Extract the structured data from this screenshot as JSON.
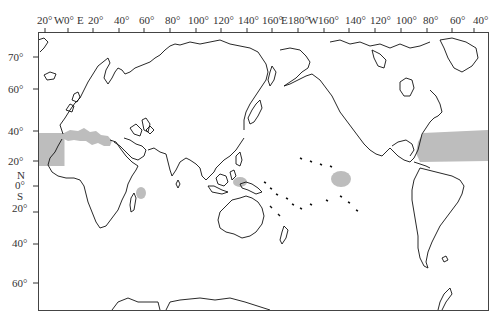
{
  "map": {
    "title": "",
    "projection": "Pacific-centered equirectangular world map",
    "colors": {
      "land_outline": "#111111",
      "shaded_region": "#bdbdbd",
      "frame": "#444444",
      "background": "#ffffff"
    },
    "top_axis_labels": [
      {
        "text": "20°",
        "x": 37
      },
      {
        "text": "W",
        "x": 54
      },
      {
        "text": "0°",
        "x": 64
      },
      {
        "text": "E",
        "x": 77
      },
      {
        "text": "20°",
        "x": 88
      },
      {
        "text": "40°",
        "x": 114
      },
      {
        "text": "60°",
        "x": 139
      },
      {
        "text": "80°",
        "x": 165
      },
      {
        "text": "100°",
        "x": 188
      },
      {
        "text": "120°",
        "x": 213
      },
      {
        "text": "140°",
        "x": 238
      },
      {
        "text": "160°",
        "x": 262
      },
      {
        "text": "E",
        "x": 281
      },
      {
        "text": "180°",
        "x": 288
      },
      {
        "text": "W",
        "x": 308
      },
      {
        "text": "160°",
        "x": 318
      },
      {
        "text": "140°",
        "x": 345
      },
      {
        "text": "120°",
        "x": 370
      },
      {
        "text": "100°",
        "x": 396
      },
      {
        "text": "80°",
        "x": 423
      },
      {
        "text": "60°",
        "x": 450
      },
      {
        "text": "40°",
        "x": 473
      }
    ],
    "top_ticks_x": [
      45,
      68,
      93,
      119,
      144,
      170,
      196,
      221,
      247,
      272,
      298,
      324,
      349,
      375,
      401,
      427,
      452,
      474
    ],
    "left_axis_labels": [
      {
        "text": "70°",
        "y": 56
      },
      {
        "text": "60°",
        "y": 88
      },
      {
        "text": "40°",
        "y": 128
      },
      {
        "text": "20°",
        "y": 158
      },
      {
        "text": "N",
        "y": 172
      },
      {
        "text": "0°",
        "y": 183
      },
      {
        "text": "S",
        "y": 193
      },
      {
        "text": "20°",
        "y": 206
      },
      {
        "text": "40°",
        "y": 240
      },
      {
        "text": "60°",
        "y": 279
      }
    ],
    "left_ticks_y": [
      57,
      89,
      131,
      161,
      186,
      212,
      244,
      283
    ],
    "shaded_regions": [
      {
        "name": "Eastern North Atlantic off NW Africa",
        "type": "rect"
      },
      {
        "name": "Mediterranean Sea",
        "type": "poly"
      },
      {
        "name": "Western North Atlantic / Sargasso Sea",
        "type": "rect"
      },
      {
        "name": "Western Indian Ocean near Madagascar",
        "type": "ellipse"
      },
      {
        "name": "Western Pacific near New Guinea",
        "type": "ellipse"
      },
      {
        "name": "Central Pacific near Hawaii-south",
        "type": "ellipse"
      }
    ]
  }
}
